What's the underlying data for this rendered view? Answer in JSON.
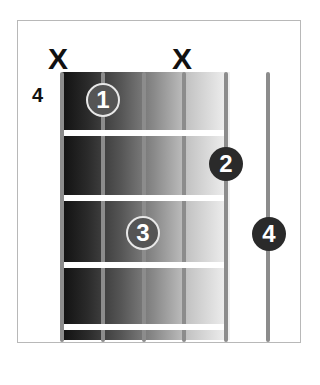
{
  "diagram": {
    "type": "guitar-chord-chart",
    "start_fret_label": "4",
    "muted_marker": "X",
    "muted_strings": [
      1,
      4
    ],
    "strings": 6,
    "frets_shown": 4,
    "fingers": [
      {
        "label": "1",
        "string": 2,
        "fret": 1
      },
      {
        "label": "2",
        "string": 5,
        "fret": 2
      },
      {
        "label": "3",
        "string": 3,
        "fret": 3
      },
      {
        "label": "4",
        "string": 6,
        "fret": 3
      }
    ]
  }
}
